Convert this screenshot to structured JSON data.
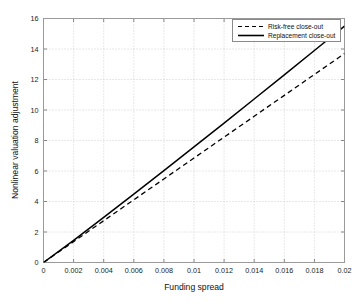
{
  "chart_data": {
    "type": "line",
    "title": "",
    "xlabel": "Funding spread",
    "ylabel": "Nonlinear valuation adjustment",
    "xlim": [
      0,
      0.02
    ],
    "ylim": [
      0,
      16
    ],
    "xticks": [
      0,
      0.002,
      0.004,
      0.006,
      0.008,
      0.01,
      0.012,
      0.014,
      0.016,
      0.018,
      0.02
    ],
    "xtick_labels": [
      "0",
      "0.002",
      "0.004",
      "0.006",
      "0.008",
      "0.01",
      "0.012",
      "0.014",
      "0.016",
      "0.018",
      "0.02"
    ],
    "yticks": [
      0,
      2,
      4,
      6,
      8,
      10,
      12,
      14,
      16
    ],
    "ytick_labels": [
      "0",
      "2",
      "4",
      "6",
      "8",
      "10",
      "12",
      "14",
      "16"
    ],
    "grid": true,
    "grid_style": "dotted",
    "legend_position": "upper right",
    "series": [
      {
        "name": "Risk-free close-out",
        "style": "dashed",
        "color": "#000000",
        "x": [
          0,
          0.002,
          0.004,
          0.006,
          0.008,
          0.01,
          0.012,
          0.014,
          0.016,
          0.018,
          0.02
        ],
        "values": [
          0,
          1.37,
          2.74,
          4.11,
          5.48,
          6.85,
          8.22,
          9.59,
          10.96,
          12.33,
          13.7
        ]
      },
      {
        "name": "Replacement close-out",
        "style": "solid",
        "color": "#000000",
        "x": [
          0,
          0.002,
          0.004,
          0.006,
          0.008,
          0.01,
          0.012,
          0.014,
          0.016,
          0.018,
          0.02
        ],
        "values": [
          0,
          1.45,
          2.96,
          4.48,
          6.02,
          7.58,
          9.14,
          10.72,
          12.3,
          13.9,
          15.5
        ]
      }
    ]
  },
  "legend": {
    "entries": [
      {
        "label": "Risk-free close-out",
        "style": "dashed"
      },
      {
        "label": "Replacement close-out",
        "style": "solid"
      }
    ]
  },
  "axes": {
    "x_title": "Funding spread",
    "y_title": "Nonlinear valuation adjustment"
  },
  "colors": {
    "background": "#ffffff",
    "frame": "#9a9a9a",
    "grid": "#bfbfbf",
    "line": "#000000",
    "text": "#1a1a1a"
  }
}
